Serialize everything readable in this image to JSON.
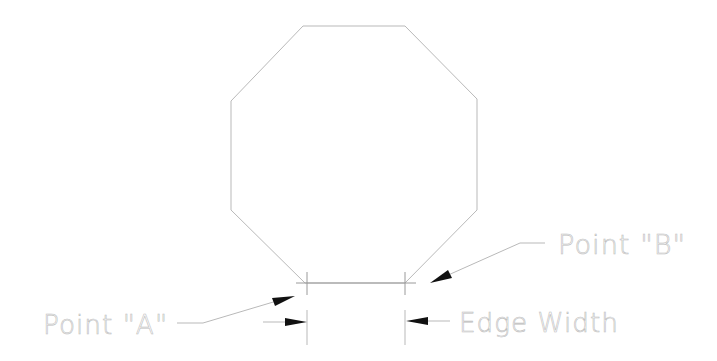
{
  "diagram": {
    "shape": "octagon",
    "labels": {
      "point_a": "Point \"A\"",
      "point_b": "Point \"B\"",
      "edge_width": "Edge Width"
    },
    "colors": {
      "line": "#b9b9b9",
      "text": "#bdbdbd",
      "arrowhead": "#111111",
      "background": "#ffffff"
    }
  }
}
